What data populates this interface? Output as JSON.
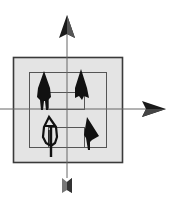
{
  "diagram": {
    "type": "coordinate-axes-with-nested-squares",
    "colors": {
      "background": "#ffffff",
      "frame_fill": "#e4e4e4",
      "frame_stroke": "#3a3a3a",
      "axis": "#555555",
      "figure": "#111111",
      "bottom_marker": "#6a6a6a"
    },
    "axes": {
      "vertical_arrow": "up-arrow",
      "horizontal_arrow": "right-arrow",
      "bottom_marker": "arrow-fletching"
    },
    "figures": [
      {
        "quadrant": "top-left",
        "shape": "solid-arrow-figure"
      },
      {
        "quadrant": "top-right",
        "shape": "solid-arrowhead"
      },
      {
        "quadrant": "bottom-left",
        "shape": "outlined-arrow-figure"
      },
      {
        "quadrant": "bottom-right",
        "shape": "tilted-arrowhead"
      }
    ]
  }
}
